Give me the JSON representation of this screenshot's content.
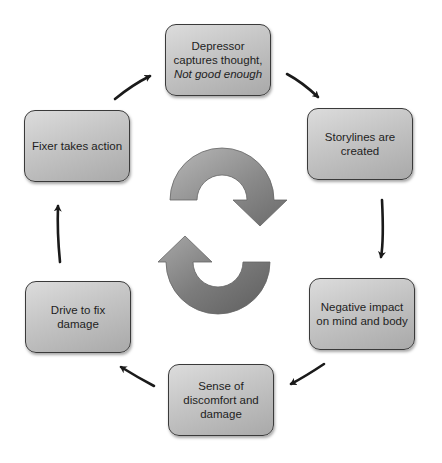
{
  "diagram": {
    "type": "cycle",
    "colors": {
      "box_fill_light": "#dcdcdc",
      "box_fill_dark": "#a9a9a9",
      "box_border": "#3a3a3a",
      "arrow": "#1a1a1a",
      "center_arrow_light": "#b5b5b5",
      "center_arrow_dark": "#6e6e6e"
    },
    "nodes": [
      {
        "id": "depressor",
        "line1": "Depressor",
        "line2": "captures thought,",
        "line3_italic": "Not good enough"
      },
      {
        "id": "storylines",
        "line1": "Storylines are",
        "line2": "created"
      },
      {
        "id": "negative-impact",
        "line1": "Negative impact",
        "line2": "on mind and body"
      },
      {
        "id": "sense-discomfort",
        "line1": "Sense of",
        "line2": "discomfort and",
        "line3": "damage"
      },
      {
        "id": "drive-fix",
        "line1": "Drive to fix",
        "line2": "damage"
      },
      {
        "id": "fixer",
        "line1": "Fixer takes action"
      }
    ],
    "edges": [
      {
        "from": "depressor",
        "to": "storylines"
      },
      {
        "from": "storylines",
        "to": "negative-impact"
      },
      {
        "from": "negative-impact",
        "to": "sense-discomfort"
      },
      {
        "from": "sense-discomfort",
        "to": "drive-fix"
      },
      {
        "from": "drive-fix",
        "to": "fixer"
      },
      {
        "from": "fixer",
        "to": "depressor"
      }
    ],
    "center_icon": "refresh-cycle-icon"
  }
}
